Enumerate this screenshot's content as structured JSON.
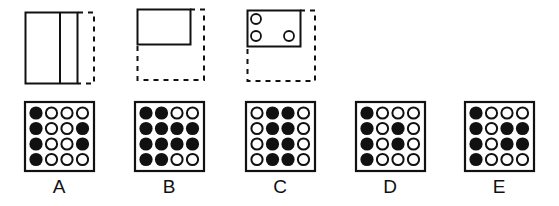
{
  "puzzle": {
    "question_figures": [
      {
        "id": "fig1",
        "description": "folded paper: solid rectangle with vertical fold line, dashed right flap"
      },
      {
        "id": "fig2",
        "description": "folded paper: solid rectangle in top-left, dashed full square outline"
      },
      {
        "id": "fig3",
        "description": "folded paper with three punched holes: two left, one right-bottom"
      }
    ],
    "hole_color": "#111111",
    "options": [
      {
        "label": "A",
        "grid": [
          [
            1,
            0,
            0,
            0
          ],
          [
            1,
            0,
            0,
            1
          ],
          [
            1,
            0,
            0,
            1
          ],
          [
            1,
            0,
            0,
            0
          ]
        ]
      },
      {
        "label": "B",
        "grid": [
          [
            1,
            1,
            0,
            0
          ],
          [
            1,
            1,
            1,
            1
          ],
          [
            1,
            1,
            1,
            1
          ],
          [
            1,
            1,
            0,
            0
          ]
        ]
      },
      {
        "label": "C",
        "grid": [
          [
            0,
            1,
            1,
            0
          ],
          [
            0,
            1,
            1,
            0
          ],
          [
            0,
            1,
            1,
            0
          ],
          [
            0,
            1,
            1,
            0
          ]
        ]
      },
      {
        "label": "D",
        "grid": [
          [
            1,
            0,
            0,
            0
          ],
          [
            1,
            0,
            1,
            0
          ],
          [
            1,
            0,
            1,
            0
          ],
          [
            1,
            0,
            0,
            0
          ]
        ]
      },
      {
        "label": "E",
        "grid": [
          [
            1,
            0,
            0,
            0
          ],
          [
            1,
            0,
            1,
            1
          ],
          [
            1,
            0,
            1,
            1
          ],
          [
            1,
            0,
            0,
            0
          ]
        ]
      }
    ]
  }
}
